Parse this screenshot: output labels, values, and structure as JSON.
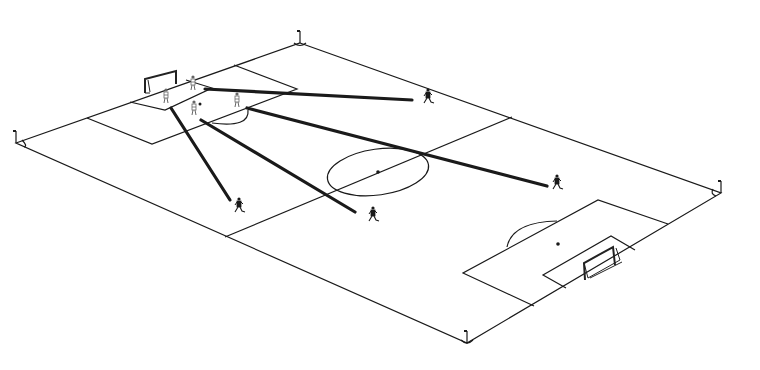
{
  "diagram": {
    "colors": {
      "background": "#ffffff",
      "lines": "#1a1a1a",
      "attacker": "#1a1a1a",
      "defender": "#666666"
    },
    "pitch": {
      "corners": {
        "top": [
          300,
          43
        ],
        "right": [
          721,
          193
        ],
        "bottom": [
          467,
          343
        ],
        "left": [
          16,
          143
        ]
      },
      "halfway_line": [
        [
          225,
          237
        ],
        [
          512,
          117
        ]
      ],
      "center_circle": {
        "cx": 378,
        "cy": 172,
        "rx": 51,
        "ry": 23,
        "rotate": -8
      },
      "center_spot": [
        378,
        172
      ],
      "left_penalty_box": [
        [
          87,
          118
        ],
        [
          152,
          144
        ],
        [
          297,
          89
        ],
        [
          234,
          65
        ]
      ],
      "left_goal_area": [
        [
          130,
          102
        ],
        [
          165,
          110
        ],
        [
          212,
          88
        ],
        [
          186,
          80
        ]
      ],
      "right_penalty_box": [
        [
          534,
          306
        ],
        [
          463,
          273
        ],
        [
          598,
          200
        ],
        [
          668,
          224
        ]
      ],
      "right_goal_area": [
        [
          566,
          288
        ],
        [
          543,
          275
        ],
        [
          611,
          236
        ],
        [
          635,
          250
        ]
      ],
      "right_penalty_spot": [
        558,
        244
      ],
      "left_penalty_spot": [
        200,
        104
      ]
    },
    "defenders": [
      {
        "id": "d1",
        "x": 166,
        "y": 97
      },
      {
        "id": "d2",
        "x": 193,
        "y": 84
      },
      {
        "id": "d3",
        "x": 194,
        "y": 109
      },
      {
        "id": "d4",
        "x": 237,
        "y": 101
      }
    ],
    "attackers": [
      {
        "id": "a1",
        "x": 428,
        "y": 97
      },
      {
        "id": "a2",
        "x": 557,
        "y": 183
      },
      {
        "id": "a3",
        "x": 373,
        "y": 215
      },
      {
        "id": "a4",
        "x": 239,
        "y": 206
      }
    ],
    "passes": [
      {
        "from": [
          205,
          89
        ],
        "to": [
          412,
          100
        ]
      },
      {
        "from": [
          247,
          108
        ],
        "to": [
          547,
          186
        ]
      },
      {
        "from": [
          201,
          120
        ],
        "to": [
          355,
          212
        ]
      },
      {
        "from": [
          171,
          108
        ],
        "to": [
          230,
          200
        ]
      }
    ]
  }
}
